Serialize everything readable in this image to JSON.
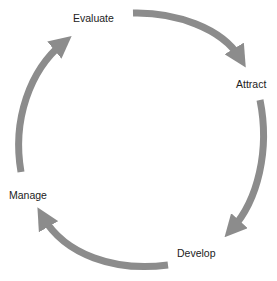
{
  "diagram": {
    "type": "cycle",
    "arrow_color": "#8c8c8c",
    "text_color": "#222222",
    "stages": [
      {
        "label": "Evaluate"
      },
      {
        "label": "Attract"
      },
      {
        "label": "Develop"
      },
      {
        "label": "Manage"
      }
    ],
    "flow": [
      {
        "from": "Evaluate",
        "to": "Attract"
      },
      {
        "from": "Attract",
        "to": "Develop"
      },
      {
        "from": "Develop",
        "to": "Manage"
      },
      {
        "from": "Manage",
        "to": "Evaluate"
      }
    ]
  }
}
